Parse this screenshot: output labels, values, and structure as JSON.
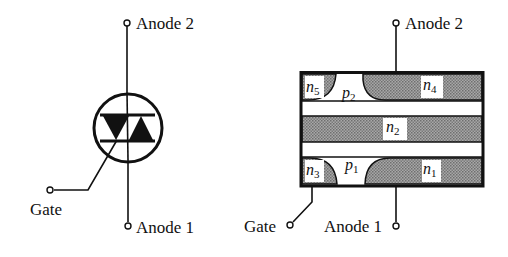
{
  "symbol": {
    "terminals": {
      "anode2": "Anode 2",
      "anode1": "Anode 1",
      "gate": "Gate"
    }
  },
  "structure": {
    "terminals": {
      "anode2": "Anode 2",
      "anode1": "Anode 1",
      "gate": "Gate"
    },
    "regions": {
      "n5": {
        "base": "n",
        "sub": "5"
      },
      "p2": {
        "base": "p",
        "sub": "2"
      },
      "n4": {
        "base": "n",
        "sub": "4"
      },
      "n2": {
        "base": "n",
        "sub": "2"
      },
      "n3": {
        "base": "n",
        "sub": "3"
      },
      "p1": {
        "base": "p",
        "sub": "1"
      },
      "n1": {
        "base": "n",
        "sub": "1"
      }
    }
  },
  "colors": {
    "ink": "#111111",
    "n_region": "#8c8c8c",
    "p_region": "#ffffff"
  }
}
